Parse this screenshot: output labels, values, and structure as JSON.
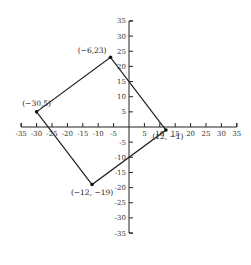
{
  "chart_data": {
    "type": "scatter",
    "title": "",
    "xlabel": "",
    "ylabel": "",
    "xlim": [
      -35,
      35
    ],
    "ylim": [
      -35,
      35
    ],
    "grid": false,
    "x_ticks": [
      -35,
      -30,
      -25,
      -20,
      -15,
      -10,
      -5,
      5,
      10,
      15,
      20,
      25,
      30,
      35
    ],
    "y_ticks": [
      35,
      30,
      25,
      20,
      15,
      10,
      5,
      -5,
      -10,
      -15,
      -20,
      -25,
      -30,
      -35
    ],
    "x_tick_labels": [
      "-35",
      "-30",
      "-25",
      "-20",
      "-15",
      "-10",
      "-5",
      "5",
      "10",
      "15",
      "20",
      "25",
      "30",
      "35"
    ],
    "y_tick_labels": [
      "35",
      "30",
      "25",
      "20",
      "15",
      "10",
      "5",
      "-5",
      "-10",
      "-15",
      "-20",
      "-25",
      "-30",
      "-35"
    ],
    "points": [
      {
        "x": -6,
        "y": 23,
        "label": "(−6,23)"
      },
      {
        "x": 12,
        "y": -1,
        "label": "(12, −1)"
      },
      {
        "x": -12,
        "y": -19,
        "label": "(−12, −19)"
      },
      {
        "x": -30,
        "y": 5,
        "label": "(−30,5)"
      }
    ],
    "polygon_closed": true
  }
}
